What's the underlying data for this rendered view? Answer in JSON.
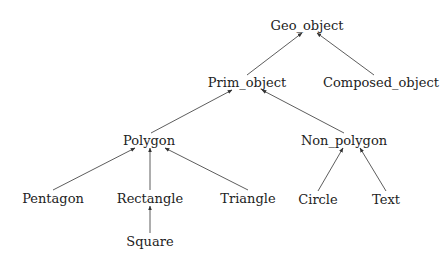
{
  "diagram": {
    "type": "class-hierarchy-tree",
    "nodes": [
      {
        "id": "geo_object",
        "label": "Geo_object",
        "x": 307,
        "y": 25
      },
      {
        "id": "prim_object",
        "label": "Prim_object",
        "x": 247,
        "y": 82
      },
      {
        "id": "composed_object",
        "label": "Composed_object",
        "x": 381,
        "y": 82
      },
      {
        "id": "polygon",
        "label": "Polygon",
        "x": 149,
        "y": 140
      },
      {
        "id": "non_polygon",
        "label": "Non_polygon",
        "x": 344,
        "y": 140
      },
      {
        "id": "pentagon",
        "label": "Pentagon",
        "x": 53,
        "y": 198
      },
      {
        "id": "rectangle",
        "label": "Rectangle",
        "x": 150,
        "y": 198
      },
      {
        "id": "triangle",
        "label": "Triangle",
        "x": 248,
        "y": 198
      },
      {
        "id": "circle",
        "label": "Circle",
        "x": 318,
        "y": 199
      },
      {
        "id": "text",
        "label": "Text",
        "x": 386,
        "y": 199
      },
      {
        "id": "square",
        "label": "Square",
        "x": 150,
        "y": 241
      }
    ],
    "edges": [
      {
        "from": "prim_object",
        "to": "geo_object",
        "x1": 247,
        "y1": 75,
        "x2": 302,
        "y2": 33
      },
      {
        "from": "composed_object",
        "to": "geo_object",
        "x1": 374,
        "y1": 75,
        "x2": 317,
        "y2": 33
      },
      {
        "from": "polygon",
        "to": "prim_object",
        "x1": 151,
        "y1": 133,
        "x2": 232,
        "y2": 90
      },
      {
        "from": "non_polygon",
        "to": "prim_object",
        "x1": 344,
        "y1": 133,
        "x2": 262,
        "y2": 90
      },
      {
        "from": "pentagon",
        "to": "polygon",
        "x1": 53,
        "y1": 190,
        "x2": 135,
        "y2": 148
      },
      {
        "from": "rectangle",
        "to": "polygon",
        "x1": 150,
        "y1": 190,
        "x2": 150,
        "y2": 148
      },
      {
        "from": "triangle",
        "to": "polygon",
        "x1": 248,
        "y1": 190,
        "x2": 165,
        "y2": 148
      },
      {
        "from": "circle",
        "to": "non_polygon",
        "x1": 318,
        "y1": 191,
        "x2": 343,
        "y2": 148
      },
      {
        "from": "text",
        "to": "non_polygon",
        "x1": 386,
        "y1": 191,
        "x2": 360,
        "y2": 148
      },
      {
        "from": "square",
        "to": "rectangle",
        "x1": 150,
        "y1": 233,
        "x2": 150,
        "y2": 206
      }
    ],
    "colors": {
      "line": "#333333",
      "text": "#222222",
      "background": "#ffffff"
    }
  }
}
